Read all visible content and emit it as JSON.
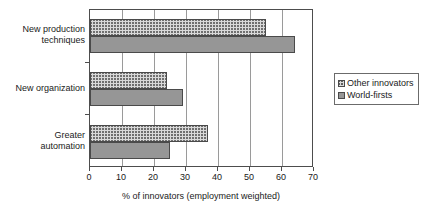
{
  "chart_data": {
    "type": "bar",
    "orientation": "horizontal",
    "title": "",
    "xlabel": "% of innovators (employment weighted)",
    "ylabel": "",
    "xlim": [
      0,
      70
    ],
    "xticks": [
      "0",
      "10",
      "20",
      "30",
      "40",
      "50",
      "60",
      "70"
    ],
    "grid": "vertical",
    "legend_position": "right",
    "categories": [
      "New production techniques",
      "New organization",
      "Greater automation"
    ],
    "category_lines": [
      [
        "New production",
        "techniques"
      ],
      [
        "New organization"
      ],
      [
        "Greater",
        "automation"
      ]
    ],
    "series": [
      {
        "name": "Other innovators",
        "fill": "hatched",
        "color": "#d9d9d9",
        "values": [
          55,
          24,
          37
        ]
      },
      {
        "name": "World-firsts",
        "fill": "solid",
        "color": "#969696",
        "values": [
          64,
          29,
          25
        ]
      }
    ]
  },
  "legend": {
    "items": [
      {
        "label": "Other innovators",
        "fill": "hatched"
      },
      {
        "label": "World-firsts",
        "fill": "solid"
      }
    ]
  },
  "colors": {
    "axis": "#4d4d4d",
    "grid": "#9a9a9a",
    "bar_outline": "#4a4a4a",
    "hatched_fill": "#d9d9d9",
    "solid_fill": "#969696",
    "text": "#1a1a1a",
    "background": "#ffffff"
  }
}
